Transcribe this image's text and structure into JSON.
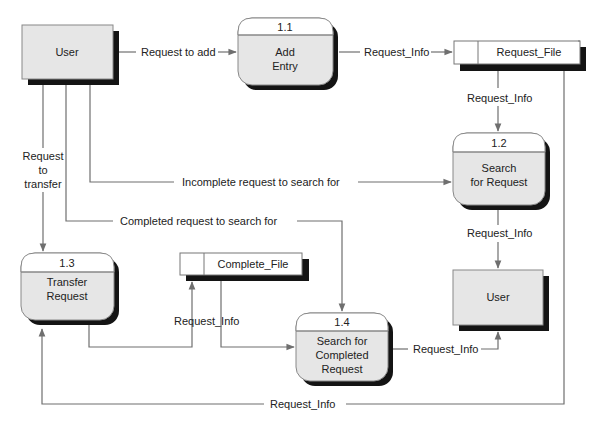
{
  "diagram": {
    "type": "data-flow-diagram",
    "external_entities": [
      {
        "id": "user_top",
        "label": "User"
      },
      {
        "id": "user_bottom",
        "label": "User"
      }
    ],
    "processes": [
      {
        "id": "p11",
        "number": "1.1",
        "lines": [
          "Add",
          "Entry"
        ]
      },
      {
        "id": "p12",
        "number": "1.2",
        "lines": [
          "Search",
          "for Request"
        ]
      },
      {
        "id": "p13",
        "number": "1.3",
        "lines": [
          "Transfer",
          "Request"
        ]
      },
      {
        "id": "p14",
        "number": "1.4",
        "lines": [
          "Search for",
          "Completed",
          "Request"
        ]
      }
    ],
    "data_stores": [
      {
        "id": "ds_request",
        "label": "Request_File"
      },
      {
        "id": "ds_complete",
        "label": "Complete_File"
      }
    ],
    "flows": [
      {
        "id": "f1",
        "from": "user_top",
        "to": "p11",
        "label": "Request to add"
      },
      {
        "id": "f2",
        "from": "p11",
        "to": "ds_request",
        "label": "Request_Info"
      },
      {
        "id": "f3",
        "from": "ds_request",
        "to": "p12",
        "label": "Request_Info"
      },
      {
        "id": "f4",
        "from": "user_top",
        "to": "p13",
        "lines": [
          "Request",
          "to",
          "transfer"
        ]
      },
      {
        "id": "f5",
        "from": "user_top",
        "to": "p12",
        "label": "Incomplete request to search for"
      },
      {
        "id": "f6",
        "from": "user_top",
        "to": "p14",
        "label": "Completed request to search for"
      },
      {
        "id": "f7",
        "from": "p12",
        "to": "user_bottom",
        "label": "Request_Info"
      },
      {
        "id": "f8",
        "from": "p13",
        "to": "ds_complete",
        "label": "Request_Info"
      },
      {
        "id": "f9",
        "from": "ds_complete",
        "to": "p14",
        "label": ""
      },
      {
        "id": "f10",
        "from": "p14",
        "to": "user_bottom",
        "label": "Request_Info"
      },
      {
        "id": "f11",
        "from": "ds_request",
        "to": "p13",
        "label": "Request_Info"
      }
    ]
  },
  "colors": {
    "box_fill": "#e6e6e6",
    "shadow": "#141414",
    "line": "#6f6f6f",
    "text": "#222222"
  }
}
